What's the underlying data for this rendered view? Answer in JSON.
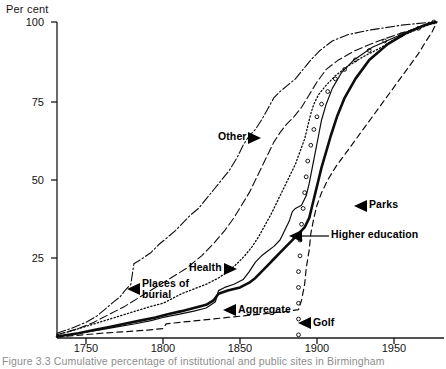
{
  "figure": {
    "caption": "Figure 3.3  Cumulative percentage of institutional and public sites in Birmingham"
  },
  "chart_data": {
    "type": "line",
    "title": "",
    "ylabel": "Per cent",
    "xlabel": "",
    "ylim": [
      0,
      100
    ],
    "xlim": [
      1731,
      1980
    ],
    "yticks": [
      25,
      50,
      75,
      100
    ],
    "ytick_labels": [
      "25",
      "50",
      "75",
      "100"
    ],
    "xticks": [
      1750,
      1800,
      1850,
      1900,
      1950
    ],
    "xtick_labels": [
      "1750",
      "1800",
      "1850",
      "1900",
      "1950"
    ],
    "grid": false,
    "legend_position": "inline-annotations",
    "series": [
      {
        "name": "Other",
        "style": "dash-dot",
        "points": [
          [
            1731,
            1.5
          ],
          [
            1740,
            3
          ],
          [
            1750,
            5
          ],
          [
            1757,
            7
          ],
          [
            1762,
            9
          ],
          [
            1768,
            11.5
          ],
          [
            1772,
            13
          ],
          [
            1776,
            15.5
          ],
          [
            1779,
            17
          ],
          [
            1781,
            23.5
          ],
          [
            1786,
            25
          ],
          [
            1792,
            27
          ],
          [
            1797,
            29.5
          ],
          [
            1802,
            31.5
          ],
          [
            1808,
            34
          ],
          [
            1813,
            36.5
          ],
          [
            1818,
            39
          ],
          [
            1823,
            41
          ],
          [
            1828,
            44
          ],
          [
            1833,
            47
          ],
          [
            1838,
            50
          ],
          [
            1843,
            53
          ],
          [
            1848,
            57
          ],
          [
            1852,
            61
          ],
          [
            1856,
            64
          ],
          [
            1860,
            66
          ],
          [
            1864,
            69
          ],
          [
            1868,
            72.5
          ],
          [
            1872,
            76
          ],
          [
            1876,
            78
          ],
          [
            1881,
            80
          ],
          [
            1886,
            82
          ],
          [
            1891,
            85
          ],
          [
            1896,
            88
          ],
          [
            1902,
            91
          ],
          [
            1910,
            94
          ],
          [
            1920,
            96
          ],
          [
            1935,
            97.5
          ],
          [
            1955,
            99
          ],
          [
            1975,
            100
          ]
        ]
      },
      {
        "name": "Places of burial",
        "style": "long-dash",
        "points": [
          [
            1731,
            1
          ],
          [
            1745,
            3
          ],
          [
            1755,
            5
          ],
          [
            1765,
            7.5
          ],
          [
            1775,
            10
          ],
          [
            1785,
            13
          ],
          [
            1795,
            16
          ],
          [
            1805,
            19
          ],
          [
            1815,
            22
          ],
          [
            1825,
            26
          ],
          [
            1833,
            30
          ],
          [
            1840,
            34
          ],
          [
            1846,
            38
          ],
          [
            1851,
            42
          ],
          [
            1856,
            46
          ],
          [
            1860,
            50
          ],
          [
            1864,
            54
          ],
          [
            1868,
            58
          ],
          [
            1872,
            62
          ],
          [
            1876,
            65
          ],
          [
            1880,
            67.5
          ],
          [
            1885,
            70
          ],
          [
            1890,
            73
          ],
          [
            1895,
            77
          ],
          [
            1900,
            81
          ],
          [
            1906,
            85
          ],
          [
            1914,
            88
          ],
          [
            1925,
            91
          ],
          [
            1940,
            94
          ],
          [
            1955,
            96.5
          ],
          [
            1968,
            98.5
          ],
          [
            1977,
            100
          ]
        ]
      },
      {
        "name": "Health",
        "style": "dotted",
        "points": [
          [
            1731,
            1
          ],
          [
            1742,
            2.5
          ],
          [
            1752,
            4
          ],
          [
            1762,
            5.5
          ],
          [
            1772,
            7
          ],
          [
            1782,
            8.5
          ],
          [
            1792,
            10
          ],
          [
            1800,
            11
          ],
          [
            1806,
            12.5
          ],
          [
            1812,
            14
          ],
          [
            1820,
            15.5
          ],
          [
            1828,
            17
          ],
          [
            1836,
            19
          ],
          [
            1842,
            21
          ],
          [
            1848,
            23.5
          ],
          [
            1853,
            26
          ],
          [
            1858,
            29
          ],
          [
            1862,
            32
          ],
          [
            1866,
            35.5
          ],
          [
            1870,
            39
          ],
          [
            1874,
            43
          ],
          [
            1878,
            47
          ],
          [
            1882,
            51
          ],
          [
            1886,
            55
          ],
          [
            1889,
            59
          ],
          [
            1892,
            63
          ],
          [
            1894,
            67
          ],
          [
            1896,
            71
          ],
          [
            1898,
            74
          ],
          [
            1901,
            77
          ],
          [
            1906,
            80
          ],
          [
            1912,
            83
          ],
          [
            1920,
            86
          ],
          [
            1930,
            89
          ],
          [
            1942,
            92
          ],
          [
            1952,
            95
          ],
          [
            1962,
            97
          ],
          [
            1972,
            99
          ],
          [
            1978,
            100
          ]
        ]
      },
      {
        "name": "Higher education",
        "style": "thin-solid",
        "points": [
          [
            1731,
            0.5
          ],
          [
            1745,
            1.5
          ],
          [
            1758,
            2.5
          ],
          [
            1770,
            3.5
          ],
          [
            1782,
            4.5
          ],
          [
            1792,
            5.5
          ],
          [
            1800,
            6.5
          ],
          [
            1810,
            7.5
          ],
          [
            1820,
            8.5
          ],
          [
            1828,
            9.5
          ],
          [
            1834,
            11.5
          ],
          [
            1836,
            15
          ],
          [
            1840,
            16
          ],
          [
            1846,
            17
          ],
          [
            1852,
            18.5
          ],
          [
            1856,
            21
          ],
          [
            1860,
            24
          ],
          [
            1864,
            26
          ],
          [
            1868,
            27.5
          ],
          [
            1872,
            29
          ],
          [
            1876,
            31
          ],
          [
            1879,
            34
          ],
          [
            1882,
            37
          ],
          [
            1884,
            40
          ],
          [
            1886,
            41
          ],
          [
            1890,
            42
          ],
          [
            1893,
            45
          ],
          [
            1895,
            49
          ],
          [
            1897,
            54
          ],
          [
            1899,
            59
          ],
          [
            1901,
            64
          ],
          [
            1903,
            69
          ],
          [
            1906,
            74
          ],
          [
            1910,
            79
          ],
          [
            1916,
            84
          ],
          [
            1924,
            88
          ],
          [
            1936,
            92
          ],
          [
            1950,
            95
          ],
          [
            1962,
            97.5
          ],
          [
            1975,
            100
          ]
        ]
      },
      {
        "name": "Aggregate",
        "style": "thick-solid",
        "points": [
          [
            1731,
            0.5
          ],
          [
            1745,
            1.5
          ],
          [
            1755,
            2.5
          ],
          [
            1765,
            3.5
          ],
          [
            1775,
            4.5
          ],
          [
            1785,
            5.5
          ],
          [
            1795,
            6.5
          ],
          [
            1803,
            7.5
          ],
          [
            1812,
            8.5
          ],
          [
            1820,
            9.5
          ],
          [
            1828,
            10.5
          ],
          [
            1833,
            12
          ],
          [
            1836,
            14
          ],
          [
            1842,
            15
          ],
          [
            1850,
            16
          ],
          [
            1856,
            17.5
          ],
          [
            1860,
            19
          ],
          [
            1864,
            21
          ],
          [
            1868,
            23
          ],
          [
            1872,
            25
          ],
          [
            1876,
            27
          ],
          [
            1880,
            29
          ],
          [
            1884,
            31
          ],
          [
            1888,
            33
          ],
          [
            1892,
            35
          ],
          [
            1895,
            38
          ],
          [
            1897,
            42
          ],
          [
            1899,
            46
          ],
          [
            1901,
            50
          ],
          [
            1903,
            54
          ],
          [
            1906,
            59
          ],
          [
            1909,
            64
          ],
          [
            1913,
            70
          ],
          [
            1918,
            76
          ],
          [
            1925,
            82
          ],
          [
            1934,
            88
          ],
          [
            1946,
            93
          ],
          [
            1958,
            96.5
          ],
          [
            1970,
            99
          ],
          [
            1977,
            100
          ]
        ]
      },
      {
        "name": "Parks",
        "style": "dashed",
        "points": [
          [
            1731,
            0.3
          ],
          [
            1748,
            1
          ],
          [
            1760,
            1.5
          ],
          [
            1775,
            2
          ],
          [
            1790,
            2.5
          ],
          [
            1800,
            3
          ],
          [
            1802,
            4.5
          ],
          [
            1812,
            5
          ],
          [
            1822,
            5.5
          ],
          [
            1832,
            6
          ],
          [
            1842,
            6.5
          ],
          [
            1852,
            7
          ],
          [
            1862,
            7.5
          ],
          [
            1872,
            8
          ],
          [
            1882,
            8.5
          ],
          [
            1888,
            9
          ],
          [
            1890,
            12
          ],
          [
            1892,
            17
          ],
          [
            1893,
            22
          ],
          [
            1895,
            28
          ],
          [
            1896,
            33
          ],
          [
            1898,
            38
          ],
          [
            1900,
            42
          ],
          [
            1903,
            46
          ],
          [
            1907,
            50
          ],
          [
            1912,
            54
          ],
          [
            1918,
            58
          ],
          [
            1924,
            62
          ],
          [
            1930,
            66
          ],
          [
            1936,
            70
          ],
          [
            1942,
            74
          ],
          [
            1948,
            78
          ],
          [
            1954,
            82
          ],
          [
            1960,
            86
          ],
          [
            1966,
            90
          ],
          [
            1971,
            94
          ],
          [
            1975,
            97
          ],
          [
            1978,
            100
          ]
        ]
      },
      {
        "name": "Golf",
        "style": "circle-marker",
        "points": [
          [
            1888,
            1
          ],
          [
            1888,
            6
          ],
          [
            1888,
            11
          ],
          [
            1888,
            16
          ],
          [
            1888,
            21
          ],
          [
            1889,
            26
          ],
          [
            1889,
            31
          ],
          [
            1890,
            36
          ],
          [
            1891,
            41
          ],
          [
            1892,
            46
          ],
          [
            1893,
            51
          ],
          [
            1894,
            56
          ],
          [
            1896,
            61
          ],
          [
            1898,
            66
          ],
          [
            1900,
            70
          ],
          [
            1903,
            74
          ],
          [
            1907,
            78
          ],
          [
            1912,
            82
          ],
          [
            1918,
            85
          ],
          [
            1925,
            88
          ],
          [
            1934,
            91
          ],
          [
            1944,
            94
          ],
          [
            1955,
            96
          ],
          [
            1966,
            98
          ],
          [
            1976,
            100
          ]
        ]
      }
    ],
    "annotations": [
      {
        "label": "Other",
        "pointer": "right"
      },
      {
        "label": "Parks",
        "pointer": "left"
      },
      {
        "label": "Higher education",
        "pointer": "left-leader"
      },
      {
        "label": "Health",
        "pointer": "right"
      },
      {
        "label": "Places of",
        "label2": "burial",
        "pointer": "left"
      },
      {
        "label": "Aggregate",
        "pointer": "left"
      },
      {
        "label": "Golf",
        "pointer": "left"
      }
    ]
  }
}
